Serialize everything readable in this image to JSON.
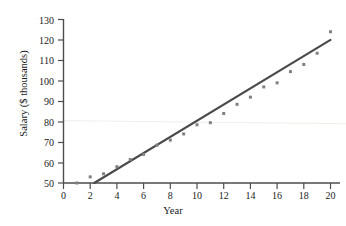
{
  "chart_data": {
    "type": "scatter",
    "title": "",
    "xlabel": "Year",
    "ylabel": "Salary ($ thousands)",
    "xlim": [
      0,
      20
    ],
    "ylim": [
      50,
      130
    ],
    "xticks": [
      0,
      2,
      4,
      6,
      8,
      10,
      12,
      14,
      16,
      18,
      20
    ],
    "yticks": [
      50,
      60,
      70,
      80,
      90,
      100,
      110,
      120,
      130
    ],
    "grid": false,
    "legend": null,
    "legend_position": "none",
    "series": [
      {
        "name": "Salary observations",
        "type": "scatter",
        "marker": "square",
        "color": "#808080",
        "x": [
          1,
          2,
          3,
          4,
          5,
          6,
          7,
          8,
          9,
          10,
          11,
          12,
          13,
          14,
          15,
          16,
          17,
          18,
          19,
          20
        ],
        "y": [
          50,
          53,
          54.5,
          58,
          61.5,
          64,
          68.5,
          71,
          74,
          78.5,
          79.5,
          84,
          88.5,
          92,
          97,
          99,
          104.5,
          108,
          113.5,
          124
        ]
      },
      {
        "name": "Fitted regression line",
        "type": "line",
        "color": "#4a4a4a",
        "x": [
          2.3,
          20
        ],
        "y": [
          50,
          120
        ]
      },
      {
        "name": "Faint reference line",
        "type": "line",
        "color": "#f0eeea",
        "x": [
          0,
          20
        ],
        "y": [
          80.5,
          79
        ]
      }
    ]
  },
  "axes": {
    "y_axis_title": "Salary ($ thousands)",
    "x_axis_title": "Year",
    "y_tick_labels": [
      "130",
      "120",
      "110",
      "100",
      "90",
      "80",
      "70",
      "60",
      "50"
    ],
    "x_tick_labels": [
      "0",
      "2",
      "4",
      "6",
      "8",
      "10",
      "12",
      "14",
      "16",
      "18",
      "20"
    ]
  },
  "colors": {
    "axis": "#4d4d4d",
    "marker": "#808080",
    "trend_line": "#4a4a4a",
    "reference_line": "#f0eeea",
    "background": "#ffffff",
    "text": "#1a1a1a"
  }
}
